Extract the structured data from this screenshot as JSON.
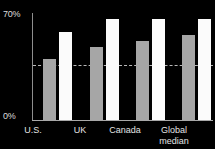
{
  "chart_data": {
    "type": "bar",
    "title": "",
    "subtitle": "",
    "xlabel": "",
    "ylabel": "",
    "categories": [
      "U.S.",
      "UK",
      "Canada",
      "Global\nmedian"
    ],
    "series": [
      {
        "name": "series-1",
        "color": "#a6a6a6",
        "values": [
          40,
          48,
          52,
          56
        ]
      },
      {
        "name": "series-2",
        "color": "#fbfbfb",
        "values": [
          58,
          67,
          67,
          67
        ]
      }
    ],
    "ylim": [
      0,
      70
    ],
    "ytick_labels": [
      "0%",
      "70%"
    ],
    "ytick_values": [
      0,
      70
    ],
    "grid": false,
    "legend": "none",
    "annotations": [
      {
        "type": "reference-line",
        "style": "dashed",
        "value": 36,
        "color": "#b9b9b9"
      }
    ],
    "background": "#000000"
  },
  "axis": {
    "y_top_label": "70%",
    "y_zero_label": "0%"
  },
  "categories": [
    {
      "label": "U.S.",
      "left": 7,
      "width": 52
    },
    {
      "label": "UK",
      "left": 54,
      "width": 52
    },
    {
      "label": "Canada",
      "left": 99,
      "width": 52
    },
    {
      "label": "Global\nmedian",
      "left": 148,
      "width": 52
    }
  ],
  "groups": [
    {
      "name": "group-us",
      "left": 10,
      "primary": 40,
      "secondary": 58
    },
    {
      "name": "group-uk",
      "left": 57,
      "primary": 48,
      "secondary": 67
    },
    {
      "name": "group-canada",
      "left": 103,
      "primary": 52,
      "secondary": 67
    },
    {
      "name": "group-global",
      "left": 149,
      "primary": 56,
      "secondary": 67
    }
  ]
}
